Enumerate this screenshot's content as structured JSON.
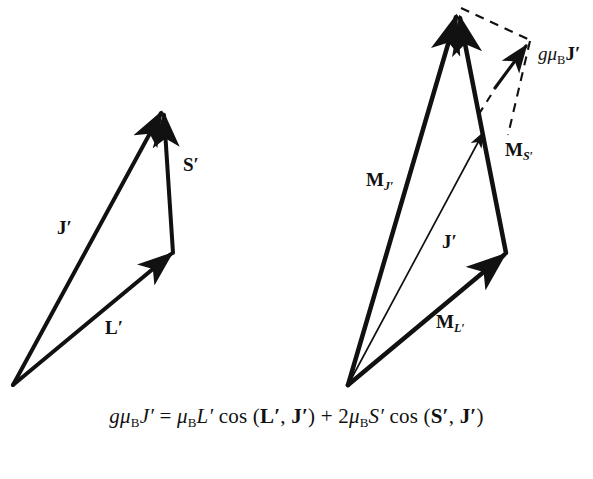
{
  "figure": {
    "type": "vector-diagram",
    "background_color": "#ffffff",
    "stroke_color": "#111111"
  },
  "left_diagram": {
    "name": "angular-momentum-triangle",
    "origin": {
      "x": 13,
      "y": 385
    },
    "apex": {
      "x": 162,
      "y": 110
    },
    "junction": {
      "x": 173,
      "y": 253
    },
    "vectors": [
      {
        "id": "J",
        "label_main": "J",
        "label_prime": "′",
        "from": "origin",
        "to": "apex",
        "style": "solid-thick",
        "label_pos": {
          "x": 57,
          "y": 218
        }
      },
      {
        "id": "L",
        "label_main": "L",
        "label_prime": "′",
        "from": "origin",
        "to": "junction",
        "style": "solid-thick",
        "label_pos": {
          "x": 105,
          "y": 318
        }
      },
      {
        "id": "S",
        "label_main": "S",
        "label_prime": "′",
        "from": "junction",
        "to": "apex",
        "style": "solid-thick",
        "label_pos": {
          "x": 183,
          "y": 155
        }
      }
    ]
  },
  "right_diagram": {
    "name": "magnetic-moment-triangle",
    "origin": {
      "x": 348,
      "y": 385
    },
    "apex": {
      "x": 458,
      "y": 12
    },
    "junction": {
      "x": 506,
      "y": 253
    },
    "j_tip": {
      "x": 484,
      "y": 130
    },
    "gmu_tip": {
      "x": 528,
      "y": 43
    },
    "vectors": [
      {
        "id": "MJ",
        "label_main": "M",
        "label_sub": "J′",
        "from": "origin",
        "to": "apex",
        "style": "solid-thick",
        "label_pos": {
          "x": 366,
          "y": 170
        }
      },
      {
        "id": "ML",
        "label_main": "M",
        "label_sub": "L′",
        "from": "origin",
        "to": "junction",
        "style": "solid-thick",
        "label_pos": {
          "x": 436,
          "y": 312
        }
      },
      {
        "id": "MS",
        "label_main": "M",
        "label_sub": "S′",
        "from": "junction",
        "to": "apex",
        "style": "solid-thick",
        "label_pos": {
          "x": 505,
          "y": 140
        }
      },
      {
        "id": "Jthin",
        "label_main": "J",
        "label_prime": "′",
        "from": "origin",
        "to": "j_tip",
        "style": "solid-thin",
        "label_pos": {
          "x": 442,
          "y": 232
        }
      },
      {
        "id": "gmuBJ",
        "label_g": "g",
        "label_mu": "μ",
        "label_subB": "B",
        "label_vec": "J",
        "label_prime": "′",
        "from": "origin",
        "to": "gmu_tip",
        "style": "projection-arrow",
        "label_pos": {
          "x": 538,
          "y": 44
        }
      }
    ],
    "dashed_lines": [
      {
        "from": "apex",
        "to": "gmu_tip"
      },
      {
        "from": "gmu_tip",
        "to": "junction"
      }
    ]
  },
  "equation": {
    "name": "lande-g-factor-equation",
    "plain_text": "gμₒJ′ = μₒL′ cos (L′, J′) + 2μₒS′ cos (S′, J′)",
    "parts": {
      "g": "g",
      "mu": "μ",
      "subB": "B",
      "J": "J",
      "prime": "′",
      "equals": "=",
      "L": "L",
      "cos": "cos",
      "open_paren": "(",
      "comma": ",",
      "close_paren": ")",
      "plus": "+",
      "two": "2",
      "S": "S"
    }
  }
}
